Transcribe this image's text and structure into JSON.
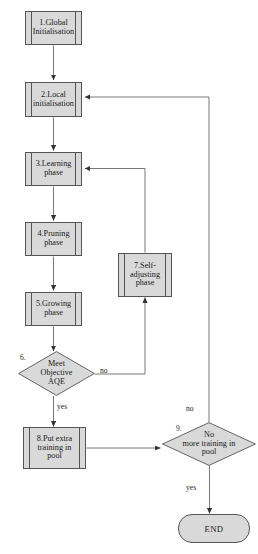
{
  "diagram": {
    "type": "flowchart",
    "colors": {
      "node_fill": "#d9d9d9",
      "node_stroke": "#555555",
      "line": "#6a6a6a",
      "text": "#1a1a1a",
      "background": "#ffffff"
    },
    "nodes": [
      {
        "id": "n1",
        "shape": "process",
        "label": "1.Global\nInitialisation"
      },
      {
        "id": "n2",
        "shape": "process",
        "label": "2.Local\ninitialisation"
      },
      {
        "id": "n3",
        "shape": "process",
        "label": "3.Learning\nphase"
      },
      {
        "id": "n4",
        "shape": "process",
        "label": "4.Pruning\nphase"
      },
      {
        "id": "n5",
        "shape": "process",
        "label": "5.Growing\nphase"
      },
      {
        "id": "n6",
        "shape": "decision",
        "label": "Meet\nObjective\nAQE",
        "number": "6."
      },
      {
        "id": "n7",
        "shape": "process",
        "label": "7.Self-\nadjusting\nphase"
      },
      {
        "id": "n8",
        "shape": "process",
        "label": "8.Put extra\ntraining in\npool"
      },
      {
        "id": "n9",
        "shape": "decision",
        "label": "No\nmore training in\npool",
        "number": "9."
      },
      {
        "id": "n10",
        "shape": "terminator",
        "label": "END"
      }
    ],
    "edge_labels": {
      "decision6_no": "no",
      "decision6_yes": "yes",
      "decision9_no": "no",
      "decision9_yes": "yes"
    },
    "edges": [
      {
        "from": "n1",
        "to": "n2",
        "label": ""
      },
      {
        "from": "n2",
        "to": "n3",
        "label": ""
      },
      {
        "from": "n3",
        "to": "n4",
        "label": ""
      },
      {
        "from": "n4",
        "to": "n5",
        "label": ""
      },
      {
        "from": "n5",
        "to": "n6",
        "label": ""
      },
      {
        "from": "n6",
        "to": "n7",
        "label": "no"
      },
      {
        "from": "n6",
        "to": "n8",
        "label": "yes"
      },
      {
        "from": "n7",
        "to": "n3",
        "label": ""
      },
      {
        "from": "n8",
        "to": "n9",
        "label": ""
      },
      {
        "from": "n9",
        "to": "n2",
        "label": "no"
      },
      {
        "from": "n9",
        "to": "n10",
        "label": "yes"
      }
    ]
  }
}
